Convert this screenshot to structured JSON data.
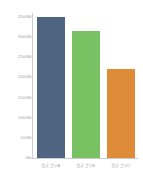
{
  "chart_data": {
    "type": "bar",
    "title": "",
    "subtitle": "",
    "xlabel": "",
    "ylabel": "",
    "categories": [
      "カテゴリA",
      "カテゴリB",
      "カテゴリC"
    ],
    "values": [
      3500000,
      3150000,
      2200000
    ],
    "value_labels": [
      "3500K",
      "3150K",
      "2200K"
    ],
    "bar_colors": [
      "#4f6480",
      "#79c263",
      "#de8c38"
    ],
    "ylim": [
      0,
      3500000
    ],
    "ytick_values": [
      3500000,
      3000000,
      2500000,
      2000000,
      1500000,
      1000000,
      500000,
      0
    ],
    "ytick_labels": [
      "3500K",
      "3000K",
      "2500K",
      "2000K",
      "1500K",
      "1000K",
      "500K",
      "0K"
    ],
    "grid": false,
    "legend": "none",
    "axis_color": "#c9cdd4",
    "tick_label_color": "#9aa0a8",
    "background": "#ffffff"
  }
}
